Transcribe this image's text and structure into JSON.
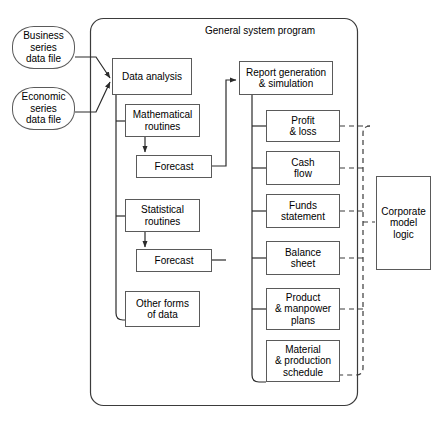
{
  "diagram": {
    "title": "General system program",
    "container_label": "General system program",
    "inputs": [
      {
        "id": "business-series-data-file",
        "label": "Business\nseries\ndata file"
      },
      {
        "id": "economic-series-data-file",
        "label": "Economic\nseries\ndata file"
      }
    ],
    "analysis_branch": [
      {
        "id": "data-analysis",
        "label": "Data analysis"
      },
      {
        "id": "mathematical-routines",
        "label": "Mathematical\nroutines"
      },
      {
        "id": "forecast-mathematical",
        "label": "Forecast"
      },
      {
        "id": "statistical-routines",
        "label": "Statistical\nroutines"
      },
      {
        "id": "forecast-statistical",
        "label": "Forecast"
      },
      {
        "id": "other-forms-of-data",
        "label": "Other forms\nof data"
      }
    ],
    "reporting_branch": [
      {
        "id": "report-generation-simulation",
        "label": "Report generation\n& simulation"
      },
      {
        "id": "profit-loss",
        "label": "Profit\n& loss"
      },
      {
        "id": "cash-flow",
        "label": "Cash\nflow"
      },
      {
        "id": "funds-statement",
        "label": "Funds\nstatement"
      },
      {
        "id": "balance-sheet",
        "label": "Balance\nsheet"
      },
      {
        "id": "product-manpower-plans",
        "label": "Product\n& manpower\nplans"
      },
      {
        "id": "material-production-schedule",
        "label": "Material\n& production\nschedule"
      }
    ],
    "external": [
      {
        "id": "corporate-model-logic",
        "label": "Corporate\nmodel\nlogic"
      }
    ],
    "colors": {
      "background": "#ffffff",
      "node_border": "#5a5a5a",
      "container_border": "#3b3b3b",
      "connector": "#2b2b2b",
      "dashed_connector": "#3b3b3b",
      "text": "#000000"
    }
  }
}
